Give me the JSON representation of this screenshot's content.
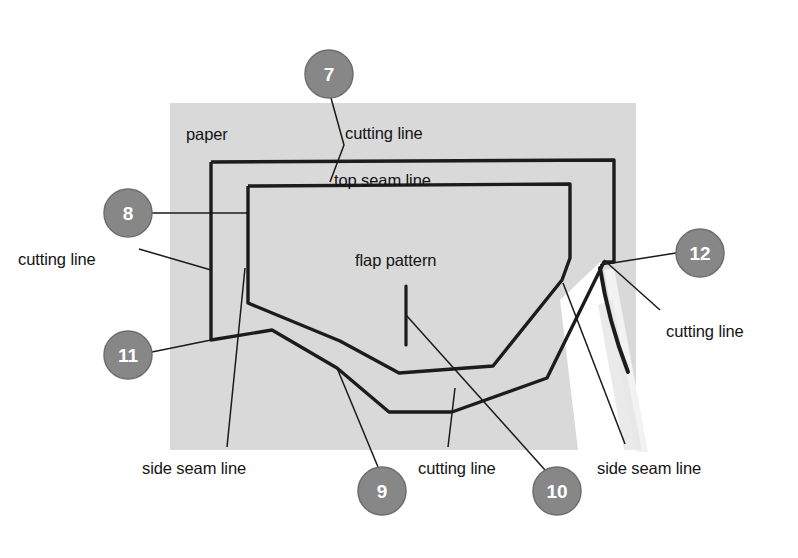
{
  "diagram": {
    "colors": {
      "paper_fill": "#d9d9d9",
      "paper_cut_gap": "#ffffff",
      "line": "#1c1c1c",
      "leader": "#1a1a1a",
      "callout_fill": "#878787",
      "callout_stroke": "#6e6e6e",
      "callout_text": "#ffffff",
      "background": "#ffffff",
      "label_text": "#141414"
    },
    "labels": [
      {
        "id": "paper",
        "text": "paper",
        "x": 186,
        "y": 125
      },
      {
        "id": "cutting-top",
        "text": "cutting line",
        "x": 345,
        "y": 124
      },
      {
        "id": "top-seam",
        "text": "top seam line",
        "x": 334,
        "y": 171
      },
      {
        "id": "flap-pattern",
        "text": "flap pattern",
        "x": 355,
        "y": 251
      },
      {
        "id": "cutting-left",
        "text": "cutting line",
        "x": 18,
        "y": 250
      },
      {
        "id": "cutting-right",
        "text": "cutting line",
        "x": 666,
        "y": 322
      },
      {
        "id": "side-seam-left",
        "text": "side seam line",
        "x": 142,
        "y": 459
      },
      {
        "id": "cutting-bottom",
        "text": "cutting line",
        "x": 418,
        "y": 459
      },
      {
        "id": "side-seam-right",
        "text": "side seam line",
        "x": 597,
        "y": 459
      }
    ],
    "callouts": [
      {
        "id": "callout-7",
        "number": "7",
        "cx": 329,
        "cy": 74,
        "r": 24
      },
      {
        "id": "callout-8",
        "number": "8",
        "cx": 128,
        "cy": 213,
        "r": 24
      },
      {
        "id": "callout-11",
        "number": "11",
        "cx": 128,
        "cy": 355,
        "r": 24
      },
      {
        "id": "callout-12",
        "number": "12",
        "cx": 700,
        "cy": 253,
        "r": 24
      },
      {
        "id": "callout-9",
        "number": "9",
        "cx": 382,
        "cy": 491,
        "r": 24
      },
      {
        "id": "callout-10",
        "number": "10",
        "cx": 557,
        "cy": 491,
        "r": 24
      }
    ],
    "leader_lines": [
      {
        "id": "leader-7",
        "from": "callout-7",
        "points": "331,98 344,145 330,182"
      },
      {
        "id": "leader-8",
        "from": "callout-8",
        "points": "152,213 249,213"
      },
      {
        "id": "leader-11",
        "from": "callout-11",
        "points": "152,352 211,340"
      },
      {
        "id": "leader-12",
        "from": "callout-12",
        "points": "676,253 600,265"
      },
      {
        "id": "leader-9",
        "from": "callout-9",
        "points": "378,467 337,368"
      },
      {
        "id": "leader-10",
        "from": "callout-10",
        "points": "545,470 406,315"
      },
      {
        "id": "leader-cutting-left",
        "from": "cutting-left",
        "points": "139,249 211,270"
      },
      {
        "id": "leader-cutting-right",
        "from": "cutting-right",
        "points": "660,310 604,260"
      },
      {
        "id": "leader-side-seam-left",
        "from": "side-seam-left",
        "points": "227,447 245,268"
      },
      {
        "id": "leader-cutting-bottom",
        "from": "cutting-bottom",
        "points": "448,447 455,388"
      },
      {
        "id": "leader-side-seam-right",
        "from": "side-seam-right",
        "points": "625,444 563,283"
      }
    ],
    "shapes": {
      "paper_rect": {
        "x": 170,
        "y": 103,
        "width": 466,
        "height": 347
      },
      "cutting_outline": "211,162 614,160 614,262 604,262 547,378 452,412 389,412 337,368 272,330 211,340",
      "seam_outline": "248,186 570,184 570,258 562,280 493,366 399,373 340,341 248,303",
      "flap_tick": {
        "x": 406,
        "y": 286,
        "x2": 406,
        "y2": 345
      }
    }
  }
}
